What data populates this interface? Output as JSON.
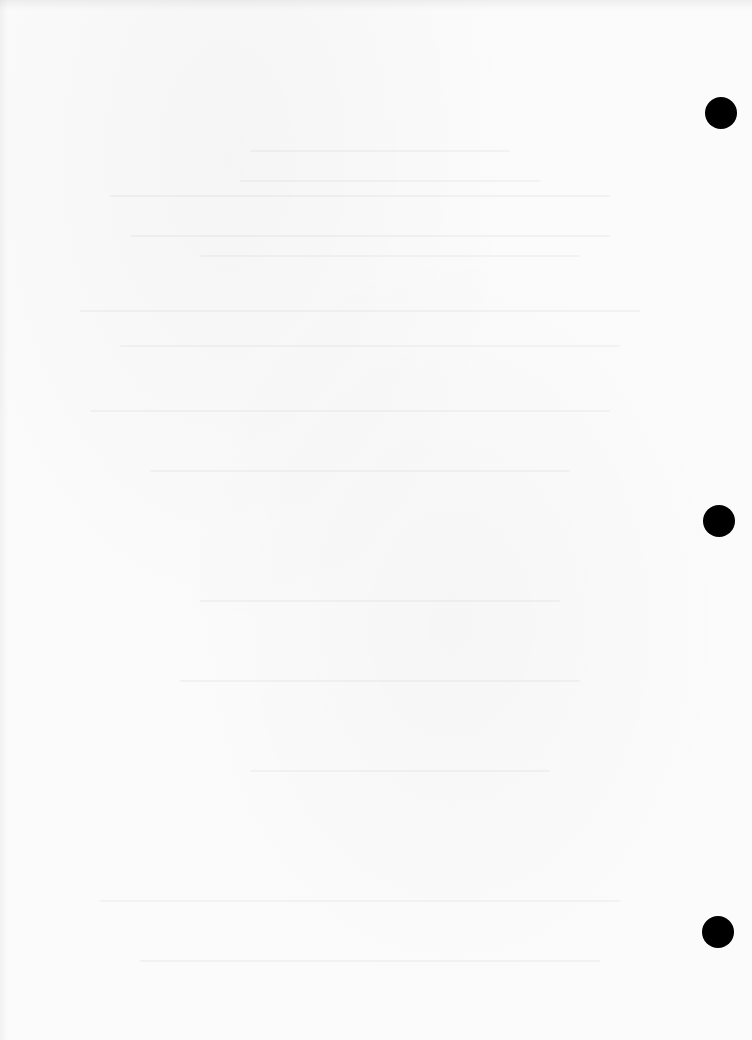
{
  "page": {
    "type": "blank scanned sheet",
    "background_color": "#fbfbfb",
    "visible_text": ""
  },
  "punch_holes": [
    {
      "cx": 721,
      "cy": 113,
      "diameter": 32,
      "color": "#000000"
    },
    {
      "cx": 719,
      "cy": 521,
      "diameter": 32,
      "color": "#000000"
    },
    {
      "cx": 718,
      "cy": 932,
      "diameter": 32,
      "color": "#000000"
    }
  ]
}
